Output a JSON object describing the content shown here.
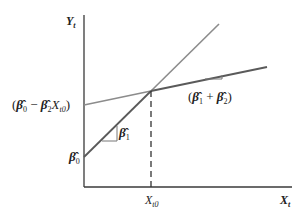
{
  "diagram": {
    "type": "piecewise-linear-regression",
    "axes": {
      "y_label": "Y",
      "y_sub": "t",
      "x_label": "X",
      "x_sub": "t"
    },
    "x_tick": {
      "label": "X",
      "sub": "t0"
    },
    "y_ticks": [
      {
        "id": "intercept_shift",
        "text_parts": [
          "(",
          "β̂",
          "0",
          " − ",
          "β̂",
          "2",
          "X",
          "t0",
          ")"
        ]
      },
      {
        "id": "intercept",
        "text_parts": [
          "β̂",
          "0"
        ]
      }
    ],
    "slope_labels": {
      "segment1": {
        "text_parts": [
          "β̂",
          "1"
        ]
      },
      "segment2": {
        "text_parts": [
          "(",
          "β̂",
          "1",
          " + ",
          "β̂",
          "2",
          ")"
        ]
      }
    },
    "colors": {
      "axis": "#3a3a3a",
      "steep_line": "#8c8c8c",
      "flat_line": "#5a5a5a",
      "dashed": "#333333"
    },
    "geometry": {
      "origin": [
        84,
        187
      ],
      "kink": [
        151,
        91
      ],
      "steep_start": [
        84,
        157
      ],
      "steep_end": [
        219,
        24
      ],
      "flat_start": [
        84,
        105
      ],
      "flat_end": [
        267,
        67
      ]
    }
  }
}
